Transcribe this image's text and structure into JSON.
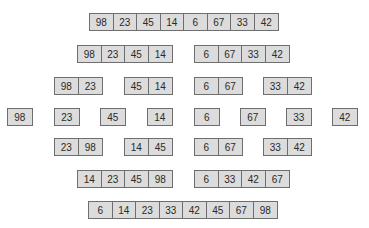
{
  "diagram": {
    "type": "merge-sort",
    "colors": {
      "cell_fill": "#dcdcdc",
      "cell_border": "#6e6e6e",
      "text": "#2a2a2a",
      "background": "#ffffff"
    },
    "rows": [
      {
        "stage": "input",
        "groups": [
          {
            "x": 89,
            "y": 13,
            "values": [
              "98",
              "23",
              "45",
              "14",
              "6",
              "67",
              "33",
              "42"
            ]
          }
        ]
      },
      {
        "stage": "split-1",
        "groups": [
          {
            "x": 77,
            "y": 45,
            "values": [
              "98",
              "23",
              "45",
              "14"
            ]
          },
          {
            "x": 194,
            "y": 45,
            "values": [
              "6",
              "67",
              "33",
              "42"
            ]
          }
        ]
      },
      {
        "stage": "split-2",
        "groups": [
          {
            "x": 54,
            "y": 77,
            "values": [
              "98",
              "23"
            ]
          },
          {
            "x": 124,
            "y": 77,
            "values": [
              "45",
              "14"
            ]
          },
          {
            "x": 194,
            "y": 77,
            "values": [
              "6",
              "67"
            ]
          },
          {
            "x": 263,
            "y": 77,
            "values": [
              "33",
              "42"
            ]
          }
        ]
      },
      {
        "stage": "split-3",
        "groups": [
          {
            "x": 7,
            "y": 108,
            "values": [
              "98"
            ]
          },
          {
            "x": 54,
            "y": 108,
            "values": [
              "23"
            ]
          },
          {
            "x": 100,
            "y": 108,
            "values": [
              "45"
            ]
          },
          {
            "x": 147,
            "y": 108,
            "values": [
              "14"
            ]
          },
          {
            "x": 194,
            "y": 108,
            "values": [
              "6"
            ]
          },
          {
            "x": 240,
            "y": 108,
            "values": [
              "67"
            ]
          },
          {
            "x": 286,
            "y": 108,
            "values": [
              "33"
            ]
          },
          {
            "x": 332,
            "y": 108,
            "values": [
              "42"
            ]
          }
        ]
      },
      {
        "stage": "merge-1",
        "groups": [
          {
            "x": 54,
            "y": 138,
            "values": [
              "23",
              "98"
            ]
          },
          {
            "x": 124,
            "y": 138,
            "values": [
              "14",
              "45"
            ]
          },
          {
            "x": 194,
            "y": 138,
            "values": [
              "6",
              "67"
            ]
          },
          {
            "x": 263,
            "y": 138,
            "values": [
              "33",
              "42"
            ]
          }
        ]
      },
      {
        "stage": "merge-2",
        "groups": [
          {
            "x": 77,
            "y": 170,
            "values": [
              "14",
              "23",
              "45",
              "98"
            ]
          },
          {
            "x": 194,
            "y": 170,
            "values": [
              "6",
              "33",
              "42",
              "67"
            ]
          }
        ]
      },
      {
        "stage": "output",
        "groups": [
          {
            "x": 88,
            "y": 201,
            "values": [
              "6",
              "14",
              "23",
              "33",
              "42",
              "45",
              "67",
              "98"
            ]
          }
        ]
      }
    ]
  }
}
